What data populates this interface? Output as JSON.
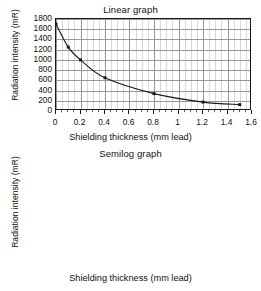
{
  "figure": {
    "axis_label_x": "Shielding thickness (mm lead)",
    "axis_label_y": "Radiation intensity (mR)"
  },
  "chart_data": [
    {
      "type": "line",
      "title": "Linear graph",
      "xlabel": "Shielding thickness (mm lead)",
      "ylabel": "Radiation intensity (mR)",
      "yscale": "linear",
      "xlim": [
        0,
        1.6
      ],
      "ylim": [
        0,
        1800
      ],
      "xticks": [
        0,
        0.2,
        0.4,
        0.6,
        0.8,
        1,
        1.2,
        1.4,
        1.6
      ],
      "xticklabels": [
        "0",
        "0.2",
        "0.4",
        "0.6",
        "0.8",
        "1",
        "1.2",
        "1.4",
        "1.6"
      ],
      "yticks": [
        0,
        200,
        400,
        600,
        800,
        1000,
        1200,
        1400,
        1600,
        1800
      ],
      "yticklabels": [
        "0",
        "200",
        "400",
        "600",
        "800",
        "1000",
        "1200",
        "1400",
        "1600",
        "1800"
      ],
      "grid": true,
      "grid_minor_x": true,
      "legend": "none",
      "markers": "square",
      "x": [
        0,
        0.1,
        0.2,
        0.4,
        0.8,
        1.2,
        1.5
      ],
      "values": [
        1700,
        1250,
        1000,
        650,
        340,
        175,
        125
      ]
    },
    {
      "type": "line",
      "title": "Semilog graph",
      "xlabel": "Shielding thickness (mm lead)",
      "ylabel": "Radiation intensity (mR)",
      "yscale": "log",
      "xlim": [
        0,
        1.6
      ],
      "ylim": [
        10,
        10000
      ],
      "xticks": [
        0,
        0.2,
        0.4,
        0.6,
        0.8,
        1,
        1.2,
        1.4,
        1.6
      ],
      "xticklabels": [
        "0",
        "0.2",
        "0.4",
        "0.6",
        "0.8",
        "1",
        "1.2",
        "1.4",
        "1.6"
      ],
      "yticks": [
        10,
        100,
        1000,
        10000
      ],
      "yticklabels": [
        "10",
        "100",
        "1000",
        "10000"
      ],
      "grid": true,
      "grid_minor_x": true,
      "grid_minor_y": true,
      "legend": "none",
      "markers": "square",
      "x": [
        0,
        0.1,
        0.2,
        0.4,
        0.8,
        1.2,
        1.5
      ],
      "values": [
        1700,
        1250,
        1000,
        650,
        340,
        175,
        125
      ]
    }
  ],
  "style": {
    "line_color": "#1a1a1a",
    "grid_color": "#8c8c8c",
    "minor_grid_color": "#b8b8b8",
    "axis_color": "#1a1a1a",
    "background": "#ffffff"
  }
}
